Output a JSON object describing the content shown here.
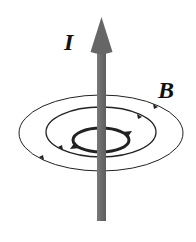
{
  "diagram": {
    "labels": {
      "current": "I",
      "field": "B"
    },
    "colors": {
      "wire": "#6e6e6e",
      "arrowhead": "#666666",
      "field_lines": "#222222",
      "text": "#111111",
      "background": "#ffffff"
    },
    "elements": {
      "wire": {
        "direction": "up"
      },
      "field_loops": [
        {
          "name": "outer",
          "direction": "counterclockwise (viewed from above)"
        },
        {
          "name": "middle",
          "direction": "counterclockwise (viewed from above)"
        },
        {
          "name": "inner",
          "direction": "counterclockwise (viewed from above)",
          "emphasis": "thick"
        }
      ]
    }
  }
}
